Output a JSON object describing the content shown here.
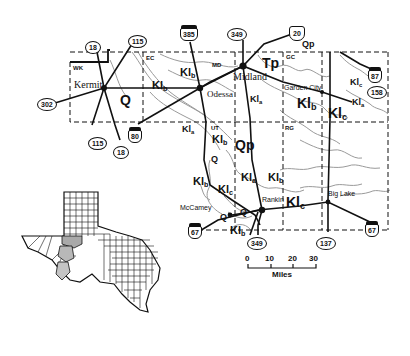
{
  "figure": {
    "type": "geologic map",
    "colors": {
      "ink": "#111111",
      "contour": "#9a9a9a",
      "highlight_county": "#a9a9a9",
      "study_county": "#c4c4c4",
      "background": "#ffffff"
    }
  },
  "counties": [
    {
      "code": "WK",
      "name": "Winkler"
    },
    {
      "code": "EC",
      "name": "Ector"
    },
    {
      "code": "MD",
      "name": "Midland"
    },
    {
      "code": "GC",
      "name": "Glasscock"
    },
    {
      "code": "UT",
      "name": "Upton"
    },
    {
      "code": "RG",
      "name": "Reagan"
    }
  ],
  "cities": {
    "kermit": "Kermit",
    "odessa": "Odessa",
    "midland": "Midland",
    "garden_city": "Garden City",
    "mccamey": "McCamey",
    "rankin": "Rankin",
    "big_lake": "Big Lake"
  },
  "geologic_units": {
    "Q": "Q",
    "Qp": "Qp",
    "Tp": "Tp",
    "Kla_base": "Kl",
    "Kla_sub": "a",
    "Klb_base": "Kl",
    "Klb_sub": "b",
    "Klc_base": "Kl",
    "Klc_sub": "c"
  },
  "highways": {
    "state": [
      "18",
      "115",
      "302",
      "349",
      "158",
      "137"
    ],
    "us": [
      "385",
      "80",
      "87",
      "67"
    ],
    "interstate": [
      "20"
    ]
  },
  "labels": {
    "hw_18_top": "18",
    "hw_115_top": "115",
    "hw_302": "302",
    "hw_385": "385",
    "hw_349_top": "349",
    "hw_20": "20",
    "hw_87": "87",
    "hw_158": "158",
    "hw_115_bottom": "115",
    "hw_18_bottom": "18",
    "hw_80": "80",
    "hw_67_left": "67",
    "hw_349_bottom": "349",
    "hw_137": "137",
    "hw_67_right": "67"
  },
  "scale_bar": {
    "ticks": [
      "0",
      "10",
      "20",
      "30"
    ],
    "unit": "Miles"
  },
  "inset": {
    "description": "Texas county locator map with study area counties shaded"
  }
}
